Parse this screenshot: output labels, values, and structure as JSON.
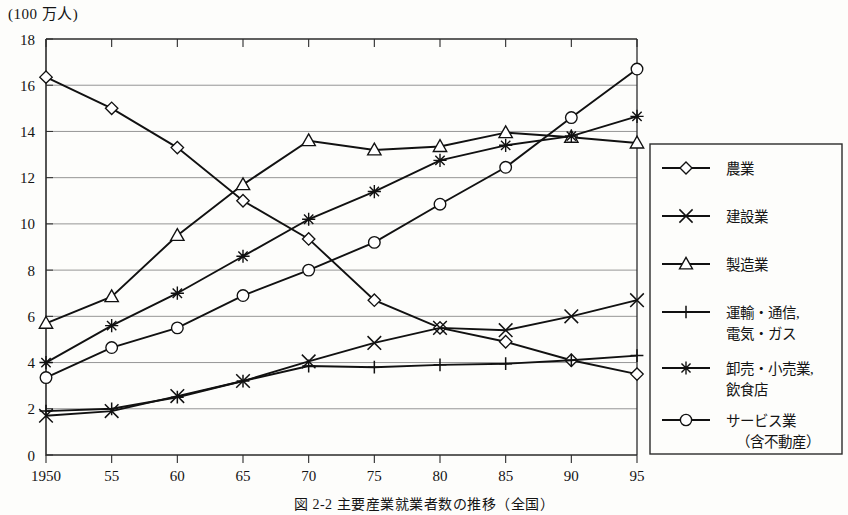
{
  "figure": {
    "unit_label": "(100 万人)",
    "caption": "図 2-2  主要産業就業者数の推移（全国）"
  },
  "chart_data": {
    "type": "line",
    "title": "",
    "xlabel": "",
    "ylabel": "(100 万人)",
    "x": [
      1950,
      55,
      60,
      65,
      70,
      75,
      80,
      85,
      90,
      95
    ],
    "xticklabels": [
      "1950",
      "55",
      "60",
      "65",
      "70",
      "75",
      "80",
      "85",
      "90",
      "95"
    ],
    "yticklabels": [
      "0",
      "2",
      "4",
      "6",
      "8",
      "10",
      "12",
      "14",
      "16",
      "18"
    ],
    "ylim": [
      0,
      18
    ],
    "ytick_step": 2,
    "grid": "horizontal",
    "legend_position": "right-outside",
    "series": [
      {
        "name": "農業",
        "marker": "diamond",
        "values": [
          16.35,
          15.0,
          13.3,
          11.0,
          9.35,
          6.7,
          5.5,
          4.9,
          4.1,
          3.5
        ]
      },
      {
        "name": "建設業",
        "marker": "x",
        "values": [
          1.7,
          1.9,
          2.55,
          3.2,
          4.05,
          4.85,
          5.5,
          5.4,
          6.0,
          6.7
        ]
      },
      {
        "name": "製造業",
        "marker": "triangle",
        "values": [
          5.7,
          6.85,
          9.5,
          11.7,
          13.6,
          13.2,
          13.35,
          13.95,
          13.75,
          13.5
        ]
      },
      {
        "name": "運輸・通信, 電気・ガス",
        "marker": "plus",
        "values": [
          1.9,
          2.0,
          2.5,
          3.2,
          3.85,
          3.8,
          3.9,
          3.95,
          4.1,
          4.3
        ]
      },
      {
        "name": "卸売・小売業, 飲食店",
        "marker": "asterisk",
        "values": [
          4.0,
          5.6,
          7.0,
          8.6,
          10.2,
          11.4,
          12.75,
          13.4,
          13.8,
          14.65
        ]
      },
      {
        "name": "サービス業 (含不動産)",
        "marker": "circle",
        "values": [
          3.35,
          4.65,
          5.5,
          6.9,
          8.0,
          9.2,
          10.85,
          12.45,
          14.6,
          16.7
        ]
      }
    ]
  },
  "legend": {
    "entries": [
      {
        "marker": "diamond",
        "label": "農業",
        "label2": ""
      },
      {
        "marker": "x",
        "label": "建設業",
        "label2": ""
      },
      {
        "marker": "triangle",
        "label": "製造業",
        "label2": ""
      },
      {
        "marker": "plus",
        "label": "運輸・通信,",
        "label2": "電気・ガス"
      },
      {
        "marker": "asterisk",
        "label": "卸売・小売業,",
        "label2": "飲食店"
      },
      {
        "marker": "circle",
        "label": "サービス業",
        "label2": "（含不動産）"
      }
    ]
  },
  "colors": {
    "line": "#111111",
    "grid": "#8a8a8a",
    "axis": "#2b2b2b",
    "marker_fill": "#ffffff",
    "background": "#fdfdfb"
  }
}
